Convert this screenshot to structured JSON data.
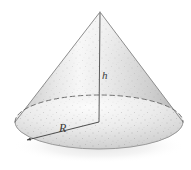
{
  "figure": {
    "kind": "geometry-diagram",
    "shape": "cone",
    "caption": "",
    "background_color": "#ffffff",
    "labels": {
      "height": "h",
      "radius": "R"
    },
    "watermark_text": "",
    "colors": {
      "surface_light": "#f4f4f4",
      "surface_mid": "#d9d9d9",
      "surface_dark": "#b4b4b4",
      "outline": "#8a8a8a",
      "dashed_edge": "#6f6f6f",
      "leader_line": "#4a4a4a",
      "label_text": "#3a3a3a",
      "speckle": "#7a7a7a"
    },
    "geometry": {
      "apex_x": 100,
      "apex_y": 12,
      "center_x": 99,
      "center_y": 122,
      "radius_x": 84,
      "radius_y": 27,
      "height_px": 110,
      "radius_arrow_tip_x": 25,
      "radius_arrow_tip_y": 141
    }
  }
}
